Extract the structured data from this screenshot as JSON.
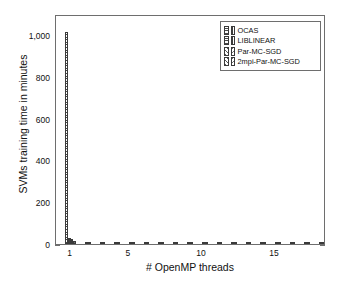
{
  "chart_data": {
    "type": "bar",
    "title": "",
    "xlabel": "# OpenMP threads",
    "ylabel": "SVMs training time in minutes",
    "xlim": [
      0,
      18.5
    ],
    "ylim": [
      0,
      1100
    ],
    "grid": false,
    "legend_position": "top-right",
    "xticks": [
      1,
      5,
      10,
      15
    ],
    "xtick_labels": [
      "1",
      "5",
      "10",
      "15"
    ],
    "yticks": [
      0,
      200,
      400,
      600,
      800,
      1000
    ],
    "ytick_labels": [
      "0",
      "200",
      "400",
      "600",
      "800",
      "1,000"
    ],
    "series": [
      {
        "name": "OCAS",
        "pattern": "horizontal-hatch",
        "x": [
          1
        ],
        "values": [
          1015
        ]
      },
      {
        "name": "LIBLINEAR",
        "pattern": "vertical-hatch",
        "x": [
          1
        ],
        "values": [
          27
        ]
      },
      {
        "name": "Par-MC-SGD",
        "pattern": "diagonal-hatch-up",
        "x": [
          1,
          2,
          3,
          4,
          5,
          6,
          7,
          8,
          9,
          10,
          11,
          12,
          13,
          14,
          15,
          16,
          17,
          18
        ],
        "values": [
          22,
          12,
          8,
          6,
          5,
          4.5,
          4,
          3.6,
          3.3,
          3,
          2.8,
          2.7,
          2.5,
          2.4,
          2.3,
          2.2,
          2.1,
          2
        ]
      },
      {
        "name": "2mpi-Par-MC-SGD",
        "pattern": "diagonal-hatch-down",
        "x": [
          1,
          2,
          3,
          4,
          5,
          6,
          7,
          8,
          9,
          10,
          11,
          12,
          13,
          14,
          15,
          16,
          17,
          18
        ],
        "values": [
          14,
          8,
          5.5,
          4.2,
          3.5,
          3.1,
          2.8,
          2.6,
          2.4,
          2.2,
          2.1,
          2,
          1.9,
          1.8,
          1.7,
          1.6,
          1.55,
          1.5
        ]
      }
    ]
  },
  "legend": {
    "items": [
      {
        "label": "OCAS"
      },
      {
        "label": "LIBLINEAR"
      },
      {
        "label": "Par-MC-SGD"
      },
      {
        "label": "2mpi-Par-MC-SGD"
      }
    ]
  }
}
